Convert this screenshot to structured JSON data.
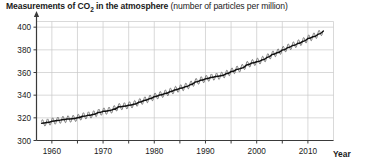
{
  "chart_data": {
    "type": "line",
    "title": "Measurements of CO2 in the atmosphere (number of particles per million)",
    "title_main": "Measurements of CO",
    "title_sub": "2",
    "title_main_tail": " in the atmosphere ",
    "title_paren": "(number of particles per million)",
    "xlabel": "Year",
    "ylabel": "",
    "xlim": [
      1957,
      2015
    ],
    "ylim": [
      300,
      405
    ],
    "yticks": [
      300,
      320,
      340,
      360,
      380,
      400
    ],
    "ytick_labels": [
      "300",
      "320",
      "340",
      "360",
      "380",
      "400"
    ],
    "xticks": [
      1960,
      1965,
      1970,
      1975,
      1980,
      1985,
      1990,
      1995,
      2000,
      2005,
      2010
    ],
    "xtick_labels": [
      "1960",
      "",
      "1970",
      "",
      "1980",
      "",
      "1990",
      "",
      "2000",
      "",
      "2010"
    ],
    "xtick_labels_major": [
      "1960",
      "1970",
      "1980",
      "1990",
      "2000",
      "2010"
    ],
    "grid": true,
    "legend": "none",
    "series": [
      {
        "name": "Atmospheric CO2 concentration",
        "units": "ppm",
        "description": "Keeling curve: annual mean trend with seasonal sawtooth oscillation",
        "seasonal_amplitude": 3.0,
        "x": [
          1958,
          1959,
          1960,
          1961,
          1962,
          1963,
          1964,
          1965,
          1966,
          1967,
          1968,
          1969,
          1970,
          1971,
          1972,
          1973,
          1974,
          1975,
          1976,
          1977,
          1978,
          1979,
          1980,
          1981,
          1982,
          1983,
          1984,
          1985,
          1986,
          1987,
          1988,
          1989,
          1990,
          1991,
          1992,
          1993,
          1994,
          1995,
          1996,
          1997,
          1998,
          1999,
          2000,
          2001,
          2002,
          2003,
          2004,
          2005,
          2006,
          2007,
          2008,
          2009,
          2010,
          2011,
          2012,
          2013
        ],
        "values": [
          315.3,
          315.9,
          316.9,
          317.6,
          318.4,
          318.9,
          319.2,
          320.0,
          321.4,
          322.2,
          323.0,
          324.6,
          325.7,
          326.3,
          327.5,
          329.7,
          330.2,
          331.1,
          332.0,
          333.8,
          335.4,
          336.8,
          338.7,
          340.1,
          341.4,
          343.0,
          344.6,
          346.0,
          347.4,
          349.2,
          351.6,
          353.1,
          354.4,
          355.6,
          356.4,
          357.1,
          358.8,
          360.8,
          362.6,
          363.8,
          366.6,
          368.3,
          369.5,
          371.0,
          373.2,
          375.8,
          377.5,
          379.8,
          381.9,
          383.8,
          385.6,
          387.4,
          389.9,
          391.6,
          393.8,
          396.5
        ]
      }
    ]
  }
}
